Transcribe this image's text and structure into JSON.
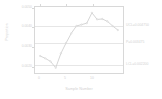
{
  "chart_data": {
    "type": "line",
    "title": "",
    "xlabel": "Sample Number",
    "ylabel": "Proportion",
    "x": [
      1,
      2,
      3,
      4,
      5,
      6,
      7,
      8,
      9,
      10,
      11,
      12,
      13,
      14,
      15,
      16
    ],
    "values": [
      0.00255,
      0.00243,
      0.00228,
      0.00196,
      0.00268,
      0.0032,
      0.00368,
      0.00405,
      0.00412,
      0.00419,
      0.00471,
      0.00438,
      0.0044,
      0.00428,
      0.00405,
      0.00385
    ],
    "xlim": [
      0,
      17
    ],
    "ylim": [
      0.0017,
      0.005
    ],
    "xticks": [
      "0",
      "5",
      "10"
    ],
    "xtick_values": [
      0,
      5,
      10
    ],
    "yticks": [
      "0.0050",
      "0.0040",
      "0.0030",
      "0.0020"
    ],
    "ytick_values": [
      0.005,
      0.004,
      0.003,
      0.002
    ],
    "grid": true,
    "legend": "none",
    "series_color": "#cfcfcf",
    "grid_color": "#e6e6e6",
    "axis_color": "#d8d8d8",
    "text_color": "#d2d2d2",
    "background": "#ffffff",
    "control_limits": [
      {
        "key": "ucl",
        "label": "UCL=0.004750",
        "value": 0.00475
      },
      {
        "key": "avg",
        "label": "P=0.003475",
        "value": 0.003475
      },
      {
        "key": "lcl",
        "label": "LCL=0.002200",
        "value": 0.0022
      }
    ],
    "annotations": [
      "UCL=0.004750",
      "P=0.003475",
      "LCL=0.002200"
    ]
  }
}
